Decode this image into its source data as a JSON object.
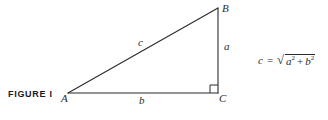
{
  "figure": {
    "caption": "FIGURE  I",
    "background_color": "#ffffff",
    "stroke_color": "#2b2b2b",
    "text_color": "#2b2b2b"
  },
  "triangle": {
    "description": "right triangle",
    "vertices": [
      {
        "label": "A",
        "x": 68,
        "y": 93,
        "label_x": 62,
        "label_y": 94
      },
      {
        "label": "B",
        "x": 218,
        "y": 8,
        "label_x": 222,
        "label_y": 3
      },
      {
        "label": "C",
        "x": 218,
        "y": 93,
        "label_x": 219,
        "label_y": 94
      }
    ],
    "sides": [
      {
        "label": "a",
        "name": "vertical-leg",
        "label_x": 224,
        "label_y": 45
      },
      {
        "label": "b",
        "name": "horizontal-leg",
        "label_x": 140,
        "label_y": 96
      },
      {
        "label": "c",
        "name": "hypotenuse",
        "label_x": 139,
        "label_y": 38
      }
    ],
    "right_angle": {
      "at_vertex": "C",
      "marker_size": 8
    }
  },
  "formula": {
    "lhs": "c",
    "equals": "=",
    "radical_sign": "√",
    "term1": "a",
    "term1_exponent": "2",
    "operator": "+",
    "term2": "b",
    "term2_exponent": "2",
    "plain_text": "c = √(a² + b²)"
  }
}
